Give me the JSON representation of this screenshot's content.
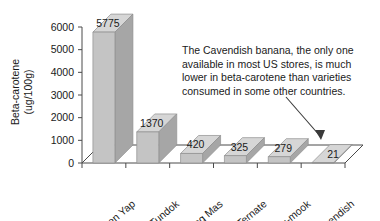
{
  "chart_data": {
    "type": "bar",
    "title": "",
    "subtitle": "",
    "xlabel": "",
    "ylabel": "Beta-carotene (ug/100g)",
    "ylabel_line1": "Beta-carotene",
    "ylabel_line2": "(ug/100g)",
    "categories": [
      "Uht en Yap",
      "Tundok",
      "Pisang Mas",
      "Ternate",
      "Hug-mook",
      "Cavendish"
    ],
    "values": [
      5775,
      1370,
      420,
      325,
      279,
      21
    ],
    "value_labels": [
      "5775",
      "1370",
      "420",
      "325",
      "279",
      "21"
    ],
    "ylim": [
      0,
      6000
    ],
    "yticks": [
      0,
      1000,
      2000,
      3000,
      4000,
      5000,
      6000
    ],
    "ytick_labels": [
      "0",
      "1000",
      "2000",
      "3000",
      "4000",
      "5000",
      "6000"
    ],
    "grid": false,
    "legend": null,
    "style": "3d-bar",
    "annotations": [
      {
        "name": "cavendish-callout",
        "lines": [
          "The Cavendish banana, the only one",
          "available in most US stores, is much",
          "lower in beta-carotene than varieties",
          "consumed in some other countries."
        ],
        "points_to_category": "Cavendish"
      }
    ]
  },
  "colors": {
    "bar_front": "#c4c4c4",
    "bar_top": "#d6d6d6",
    "bar_side": "#a6a6a6",
    "axis": "#4a4a4a",
    "text": "#1a1a1a",
    "background": "#ffffff"
  }
}
